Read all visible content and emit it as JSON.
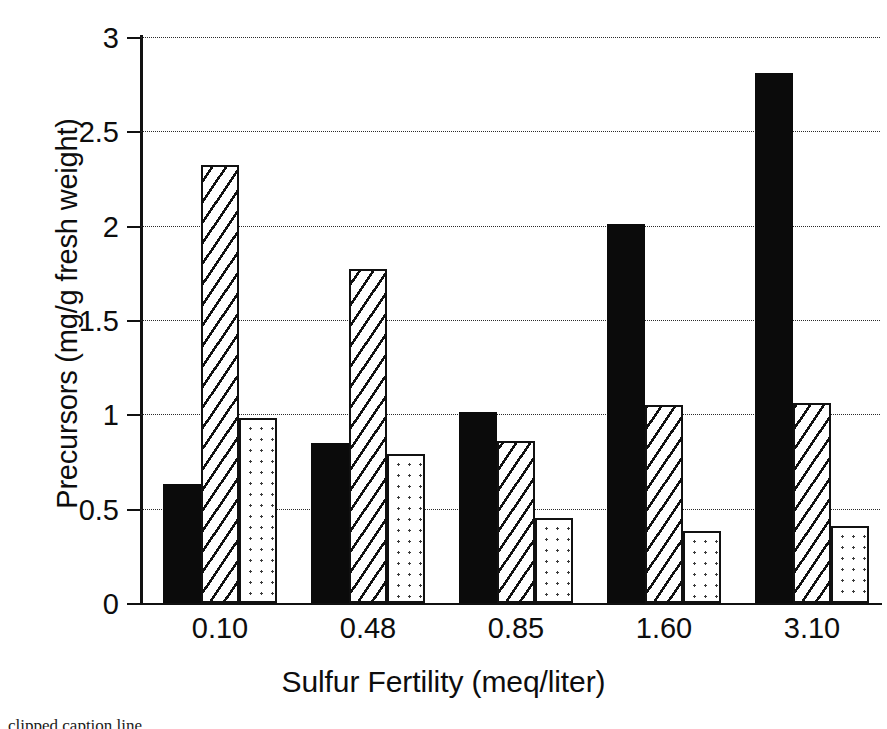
{
  "chart_data": {
    "type": "bar",
    "title": "",
    "xlabel": "Sulfur Fertility (meq/liter)",
    "ylabel": "Precursors (mg/g fresh weight)",
    "categories": [
      "0.10",
      "0.48",
      "0.85",
      "1.60",
      "3.10"
    ],
    "ylim": [
      0,
      3
    ],
    "yticks": [
      "0",
      "0.5",
      "1",
      "1.5",
      "2",
      "2.5",
      "3"
    ],
    "ytick_values": [
      0,
      0.5,
      1,
      1.5,
      2,
      2.5,
      3
    ],
    "grid": "horizontal-dotted",
    "legend": "none",
    "series": [
      {
        "name": "series-solid",
        "fill": "solid-black",
        "values": [
          0.63,
          0.85,
          1.01,
          2.01,
          2.81
        ]
      },
      {
        "name": "series-hatched",
        "fill": "diagonal-hatch",
        "values": [
          2.32,
          1.77,
          0.86,
          1.05,
          1.06
        ]
      },
      {
        "name": "series-dotted",
        "fill": "dot-stipple",
        "values": [
          0.98,
          0.79,
          0.45,
          0.38,
          0.41
        ]
      }
    ]
  },
  "caption": {
    "text": "clipped caption line"
  },
  "colors": {
    "solid": "#0b0b0b",
    "outline": "#111111",
    "grid": "#2b2b2b",
    "background": "#ffffff"
  }
}
